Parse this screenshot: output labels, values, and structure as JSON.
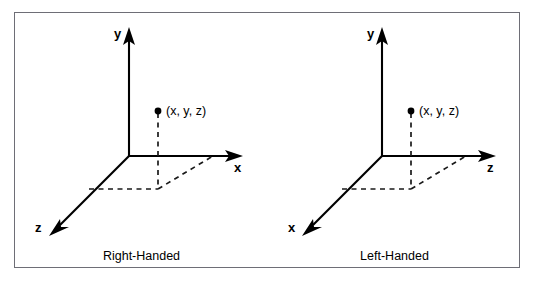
{
  "figure": {
    "border_color": "#6e6e76",
    "background": "#ffffff",
    "ink_color": "#000000",
    "panels": [
      {
        "id": "right-handed",
        "caption": "Right-Handed",
        "vertical_axis_label": "y",
        "horizontal_axis_label": "x",
        "depth_axis_label": "z",
        "point_label": "(x, y, z)"
      },
      {
        "id": "left-handed",
        "caption": "Left-Handed",
        "vertical_axis_label": "y",
        "horizontal_axis_label": "z",
        "depth_axis_label": "x",
        "point_label": "(x, y, z)"
      }
    ]
  }
}
